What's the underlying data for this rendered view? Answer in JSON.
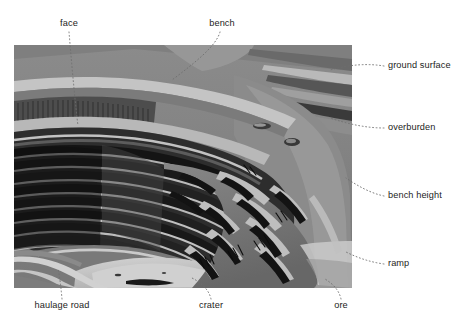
{
  "figure": {
    "kind": "annotated-photograph",
    "background_color": "#ffffff",
    "label_color": "#1d1d1b",
    "leader_color": "#6e6e6e"
  },
  "photo": {
    "alt": "aerial photograph of a terraced open-pit mine",
    "left": 14,
    "top": 45,
    "width": 338,
    "height": 243,
    "palette": {
      "ground": "#8b8b8b",
      "ground_light": "#b9b9b9",
      "bench_light": "#c9c9c9",
      "bench_mid": "#6f6f6f",
      "bench_dark": "#3a3a3a",
      "shadow": "#141414",
      "crater_floor": "#c6c6c6",
      "ore_mid": "#7a7a7a",
      "road": "#d2d2d2"
    }
  },
  "annotations": [
    {
      "id": "face",
      "label": "face",
      "position": "top",
      "text_x": 69,
      "text_y": 24,
      "align": "center"
    },
    {
      "id": "bench",
      "label": "bench",
      "position": "top",
      "text_x": 222,
      "text_y": 24,
      "align": "center"
    },
    {
      "id": "ground-surface",
      "label": "ground surface",
      "position": "right",
      "text_x": 388,
      "text_y": 66,
      "align": "left"
    },
    {
      "id": "overburden",
      "label": "overburden",
      "position": "right",
      "text_x": 388,
      "text_y": 128,
      "align": "left"
    },
    {
      "id": "bench-height",
      "label": "bench height",
      "position": "right",
      "text_x": 388,
      "text_y": 196,
      "align": "left"
    },
    {
      "id": "ramp",
      "label": "ramp",
      "position": "right",
      "text_x": 388,
      "text_y": 264,
      "align": "left"
    },
    {
      "id": "haulage-road",
      "label": "haulage road",
      "position": "bottom",
      "text_x": 62,
      "text_y": 306,
      "align": "center"
    },
    {
      "id": "crater",
      "label": "crater",
      "position": "bottom",
      "text_x": 211,
      "text_y": 306,
      "align": "center"
    },
    {
      "id": "ore",
      "label": "ore",
      "position": "bottom",
      "text_x": 341,
      "text_y": 306,
      "align": "center"
    }
  ]
}
